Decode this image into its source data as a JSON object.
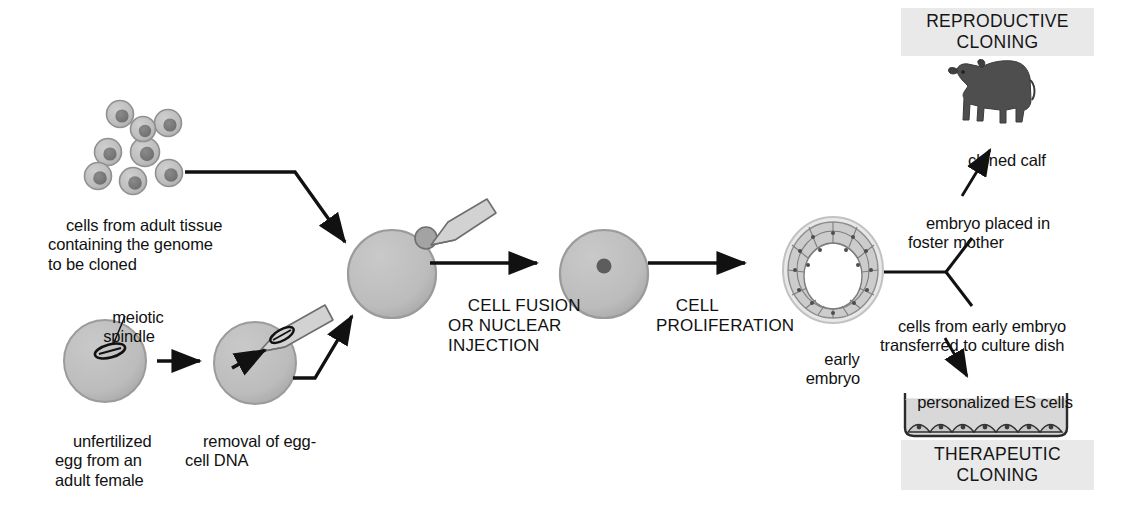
{
  "figure": {
    "topic": "cloning-workflow",
    "background_color": "#ffffff",
    "ink_color": "#111111",
    "cell_fill": "#bdbdbd",
    "cell_stroke": "#8f8f8f",
    "nucleus_fill": "#7a7a7a",
    "banner_fill": "#e9e9e9",
    "pipette_fill": "#d0d0d0",
    "pipette_stroke": "#6e6e6e",
    "calf_color": "#4a4a4a"
  },
  "banners": {
    "reproductive": "REPRODUCTIVE\nCLONING",
    "therapeutic": "THERAPEUTIC\nCLONING"
  },
  "stage_labels": {
    "fusion": "CELL FUSION\nOR NUCLEAR\nINJECTION",
    "proliferation": "CELL\nPROLIFERATION"
  },
  "labels": {
    "adult_cells": "cells from adult tissue\ncontaining the genome\nto be cloned",
    "meiotic_spindle": "meiotic\nspindle",
    "unfertilized_egg": "unfertilized\negg from an\nadult female",
    "egg_dna_removal": "removal of egg-\ncell DNA",
    "early_embryo": "early\nembryo",
    "foster_mother": "embryo placed in\nfoster mother",
    "culture_transfer": "cells from early embryo\ntransferred to culture dish",
    "cloned_calf": "cloned calf",
    "es_cells": "personalized ES cells"
  },
  "icons": {
    "adult_cell_cluster": "cell-cluster-icon",
    "egg_cell": "egg-cell-icon",
    "spindle": "meiotic-spindle-icon",
    "pipette": "micropipette-icon",
    "fused_cell": "fused-cell-icon",
    "blastocyst": "early-embryo-icon",
    "calf": "cloned-calf-icon",
    "culture_dish": "culture-dish-icon"
  },
  "counts": {
    "adult_cells": 8,
    "es_cells_in_dish": 7,
    "blastocyst_outer_cells": 30
  }
}
